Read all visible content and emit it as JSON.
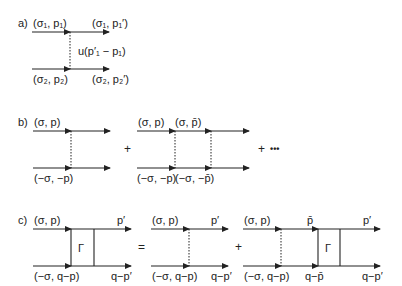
{
  "panels": {
    "a": {
      "label": "a)",
      "top_in": "(σ₁, p₁)",
      "top_out": "(σ₁, p₁′)",
      "bottom_in": "(σ₂, p₂)",
      "bottom_out": "(σ₂, p₂′)",
      "interaction": "u(p′₁ − p₁)"
    },
    "b": {
      "label": "b)",
      "d1": {
        "top_in": "(σ, p)",
        "bottom_in": "(−σ, −p)"
      },
      "d2": {
        "top_in": "(σ, p)",
        "top_mid": "(σ, p̄)",
        "bottom_in": "(−σ, −p)",
        "bottom_mid": "(−σ, −p̄)"
      },
      "plus1": "+",
      "plus2": "+",
      "ellipsis": "•••"
    },
    "c": {
      "label": "c)",
      "d1": {
        "top_in": "(σ, p)",
        "top_out": "p′",
        "bottom_in": "(−σ, q−p)",
        "bottom_out": "q−p′",
        "vertex": "Γ"
      },
      "equals": "=",
      "d2": {
        "top_in": "(σ, p)",
        "top_out": "p′",
        "bottom_in": "(−σ, q−p)",
        "bottom_out": "q−p′"
      },
      "plus": "+",
      "d3": {
        "top_in": "(σ, p)",
        "top_mid": "p̄",
        "top_out": "p′",
        "bottom_in": "(−σ, q−p)",
        "bottom_mid": "q−p̄",
        "bottom_out": "q−p′",
        "vertex": "Γ"
      }
    }
  }
}
